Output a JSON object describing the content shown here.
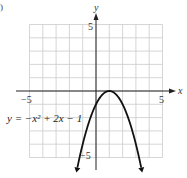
{
  "panel_marker": ")",
  "chart_data": {
    "type": "line",
    "title": "",
    "equation_label": "y = −x² + 2x − 1",
    "function": "-x^2 + 2x - 1",
    "xlabel": "x",
    "ylabel": "y",
    "xlim": [
      -5,
      5
    ],
    "ylim": [
      -5,
      5
    ],
    "grid": true,
    "x_tick_labels": [
      {
        "value": -5,
        "label": "−5"
      },
      {
        "value": 5,
        "label": "5"
      }
    ],
    "y_tick_labels": [
      {
        "value": 5,
        "label": "5"
      },
      {
        "value": -5,
        "label": "−5"
      }
    ],
    "vertex": {
      "x": 1,
      "y": 0
    },
    "y_intercept": {
      "x": 0,
      "y": -1
    },
    "points": [
      {
        "x": -1.45,
        "y": -6.0
      },
      {
        "x": -1,
        "y": -4
      },
      {
        "x": -0.5,
        "y": -2.25
      },
      {
        "x": 0,
        "y": -1
      },
      {
        "x": 0.5,
        "y": -0.25
      },
      {
        "x": 1,
        "y": 0
      },
      {
        "x": 1.5,
        "y": -0.25
      },
      {
        "x": 2,
        "y": -1
      },
      {
        "x": 2.5,
        "y": -2.25
      },
      {
        "x": 3,
        "y": -4
      },
      {
        "x": 3.45,
        "y": -6.0
      }
    ],
    "arrows_at_ends": true,
    "colors": {
      "curve": "#111111",
      "grid": "#cccccc",
      "axes": "#222222"
    }
  }
}
